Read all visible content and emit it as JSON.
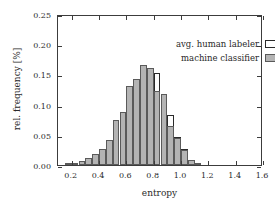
{
  "chart_data": {
    "type": "bar",
    "title": "",
    "xlabel": "entropy",
    "ylabel": "rel. frequency [%]",
    "xlim": [
      0.1,
      1.6
    ],
    "ylim": [
      0.0,
      0.25
    ],
    "xticks": [
      "0.2",
      "0.4",
      "0.6",
      "0.8",
      "1.0",
      "1.2",
      "1.4",
      "1.6"
    ],
    "xtick_values": [
      0.2,
      0.4,
      0.6,
      0.8,
      1.0,
      1.2,
      1.4,
      1.6
    ],
    "yticks": [
      "0.00",
      "0.05",
      "0.10",
      "0.15",
      "0.20",
      "0.25"
    ],
    "ytick_values": [
      0.0,
      0.05,
      0.1,
      0.15,
      0.2,
      0.25
    ],
    "grid": false,
    "bin_width": 0.05,
    "bin_starts": [
      0.15,
      0.2,
      0.25,
      0.3,
      0.35,
      0.4,
      0.45,
      0.5,
      0.55,
      0.6,
      0.65,
      0.7,
      0.75,
      0.8,
      0.85,
      0.9,
      0.95,
      1.0,
      1.05,
      1.1
    ],
    "legend": {
      "position": "top-right-inside",
      "entries": [
        {
          "name": "avg. human labeler",
          "style": "hollow",
          "color": "#ffffff",
          "border": "#2a2a2a"
        },
        {
          "name": "machine classifier",
          "style": "filled",
          "color": "#b4b4b4",
          "border": "#5a5a5a"
        }
      ]
    },
    "series": [
      {
        "name": "avg. human labeler",
        "style": "hollow",
        "values": [
          0.002,
          0.003,
          0.005,
          0.009,
          0.016,
          0.026,
          0.028,
          0.05,
          0.081,
          0.107,
          0.118,
          0.143,
          0.153,
          0.153,
          0.118,
          0.083,
          0.047,
          0.026,
          0.009,
          0.003
        ]
      },
      {
        "name": "machine classifier",
        "style": "filled",
        "values": [
          0.002,
          0.003,
          0.006,
          0.011,
          0.018,
          0.026,
          0.042,
          0.074,
          0.088,
          0.131,
          0.143,
          0.166,
          0.16,
          0.122,
          0.117,
          0.065,
          0.044,
          0.025,
          0.008,
          0.003
        ]
      }
    ]
  }
}
